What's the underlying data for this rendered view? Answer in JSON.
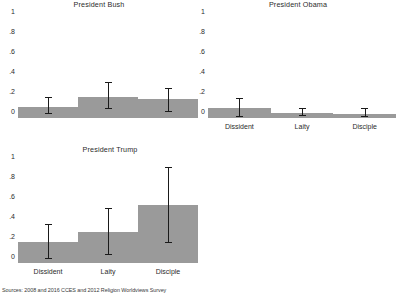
{
  "figure": {
    "source_note": "Sources: 2008 and 2016 CCES and 2012 Religion Worldviews Survey",
    "bar_color": "#9a9a9a",
    "error_color": "#1a1a1a",
    "background": "#ffffff"
  },
  "chart_data": {
    "type": "bar",
    "title": "",
    "xlabel": "",
    "ylabel": "",
    "ylim": [
      0,
      1
    ],
    "ytick_labels": [
      "0",
      ".2",
      ".4",
      ".6",
      ".8",
      "1"
    ],
    "ytick_values": [
      0,
      0.2,
      0.4,
      0.6,
      0.8,
      1
    ],
    "grid": false,
    "legend": "none",
    "categories": [
      "Dissident",
      "Laity",
      "Disciple"
    ],
    "panels": [
      {
        "name": "bush",
        "title": "President Bush",
        "show_xlabels": false,
        "values": [
          0.11,
          0.21,
          0.19
        ],
        "ci_low": [
          0.04,
          0.09,
          0.06
        ],
        "ci_high": [
          0.2,
          0.35,
          0.29
        ]
      },
      {
        "name": "obama",
        "title": "President Obama",
        "show_xlabels": true,
        "values": [
          0.1,
          0.05,
          0.04
        ],
        "ci_low": [
          0.01,
          0.02,
          0.01
        ],
        "ci_high": [
          0.19,
          0.09,
          0.09
        ]
      },
      {
        "name": "trump",
        "title": "President Trump",
        "show_xlabels": true,
        "values": [
          0.21,
          0.31,
          0.58
        ],
        "ci_low": [
          0.045,
          0.08,
          0.2
        ],
        "ci_high": [
          0.38,
          0.545,
          0.95
        ]
      }
    ]
  }
}
